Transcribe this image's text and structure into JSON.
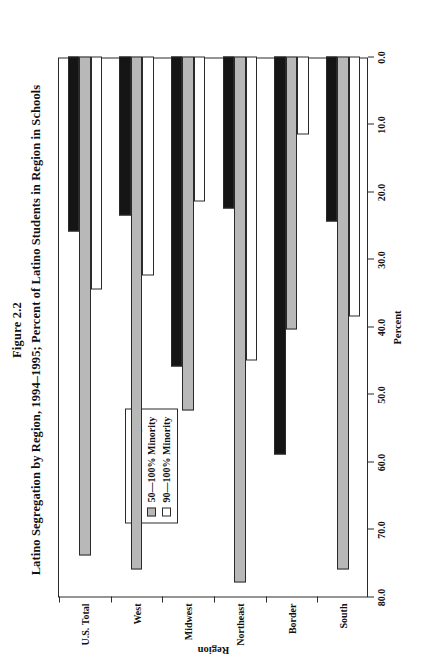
{
  "figure": {
    "number": "Figure 2.2",
    "title": "Latino Segregation by Region, 1994–1995; Percent of Latino Students in Region in Schools"
  },
  "legend": {
    "position": "top-left-inside",
    "items": [
      {
        "label": "0—50% Minority",
        "color": "#151515",
        "swatch": "legend-swatch-black"
      },
      {
        "label": "50—100% Minority",
        "color": "#b8b8b8",
        "swatch": "legend-swatch-gray"
      },
      {
        "label": "90—100% Minority",
        "color": "#ffffff",
        "swatch": "legend-swatch-white"
      }
    ]
  },
  "axes": {
    "value_axis_label": "Percent",
    "category_axis_label": "Region",
    "value_ticks": [
      "0.0",
      "10.0",
      "20.0",
      "30.0",
      "40.0",
      "50.0",
      "60.0",
      "70.0",
      "80.0"
    ]
  },
  "chart_data": {
    "type": "bar",
    "orientation": "horizontal",
    "title": "Latino Segregation by Region, 1994–1995; Percent of Latino Students in Region in Schools",
    "subtitle": "Figure 2.2",
    "xlabel": "Percent",
    "ylabel": "Region",
    "xlim": [
      0,
      80
    ],
    "xticks": [
      0,
      10,
      20,
      30,
      40,
      50,
      60,
      70,
      80
    ],
    "grid": false,
    "legend_position": "upper left (inside plot)",
    "categories": [
      "South",
      "Border",
      "Northeast",
      "Midwest",
      "West",
      "U.S. Total"
    ],
    "series": [
      {
        "name": "0—50% Minority",
        "color": "#151515",
        "values": [
          24.5,
          59.0,
          22.5,
          46.0,
          23.5,
          26.0
        ]
      },
      {
        "name": "50—100% Minority",
        "color": "#b8b8b8",
        "values": [
          76.0,
          40.5,
          78.0,
          52.5,
          76.0,
          74.0
        ]
      },
      {
        "name": "90—100% Minority",
        "color": "#ffffff",
        "values": [
          38.5,
          11.5,
          45.0,
          21.5,
          32.5,
          34.5
        ]
      }
    ]
  }
}
